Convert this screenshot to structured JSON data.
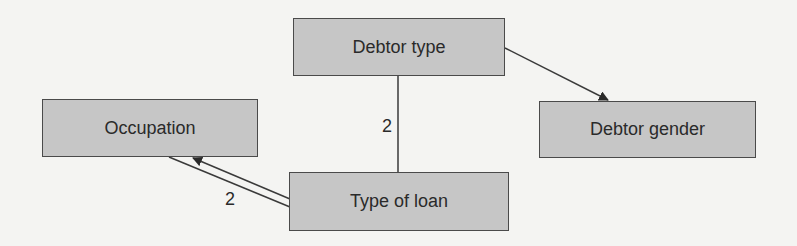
{
  "diagram": {
    "nodes": [
      {
        "id": "debtor_type",
        "label": "Debtor type"
      },
      {
        "id": "occupation",
        "label": "Occupation"
      },
      {
        "id": "debtor_gender",
        "label": "Debtor gender"
      },
      {
        "id": "type_of_loan",
        "label": "Type of loan"
      }
    ],
    "edges": [
      {
        "from": "debtor_type",
        "to": "debtor_gender",
        "label": "",
        "style": "single-arrow"
      },
      {
        "from": "debtor_type",
        "to": "type_of_loan",
        "label": "2",
        "style": "line"
      },
      {
        "from": "type_of_loan",
        "to": "occupation",
        "label": "2",
        "style": "double-arrow"
      }
    ]
  },
  "colors": {
    "background": "#f4f4f2",
    "node_fill": "#c6c6c6",
    "node_border": "#4a4a4a",
    "edge": "#3a3a3a",
    "text": "#2a2a2a"
  }
}
